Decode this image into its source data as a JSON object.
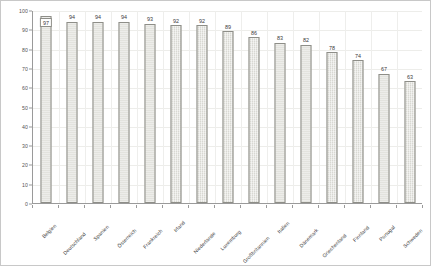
{
  "chart_data": {
    "type": "bar",
    "title": "",
    "xlabel": "",
    "ylabel": "",
    "ylim": [
      0,
      100
    ],
    "ytick_step": 10,
    "yticks": [
      0,
      10,
      20,
      30,
      40,
      50,
      60,
      70,
      80,
      90,
      100
    ],
    "grid": true,
    "legend": "none",
    "categories": [
      "Belgien",
      "Deutschland",
      "Spanien",
      "Österreich",
      "Frankreich",
      "Irland",
      "Niederlande",
      "Luxemburg",
      "Großbritannien",
      "Italien",
      "Dänemark",
      "Griechenland",
      "Finnland",
      "Portugal",
      "Schweden"
    ],
    "values": [
      97,
      94,
      94,
      94,
      93,
      92,
      92,
      89,
      86,
      83,
      82,
      78,
      74,
      67,
      63
    ],
    "data_labels": [
      "97",
      "94",
      "94",
      "94",
      "93",
      "92",
      "92",
      "89",
      "86",
      "83",
      "82",
      "78",
      "74",
      "67",
      "63"
    ],
    "highlighted_index": 0,
    "bar_color": "#d8d8d2",
    "bar_border_color": "#8e8e88",
    "axis_color": "#9a9a9a",
    "grid_color": "#ededea"
  }
}
